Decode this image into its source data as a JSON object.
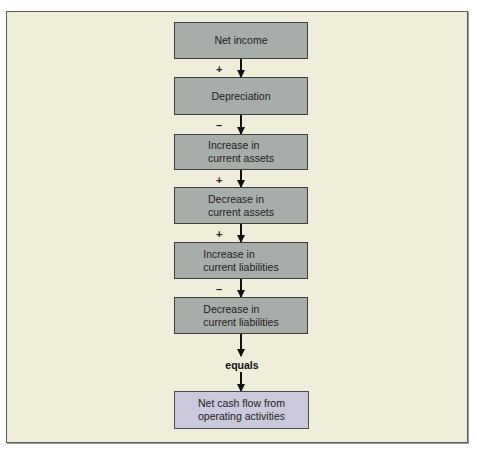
{
  "diagram": {
    "title": "",
    "colors": {
      "background": "#eeeedb",
      "box_fill": "#a7ada8",
      "final_box_fill": "#cbc9dc",
      "border": "#3d3f3e",
      "arrow": "#111111"
    },
    "steps": [
      {
        "label": "Net income"
      },
      {
        "label": "Depreciation"
      },
      {
        "label": "Increase in\ncurrent assets"
      },
      {
        "label": "Decrease in\ncurrent assets"
      },
      {
        "label": "Increase in\ncurrent liabilities"
      },
      {
        "label": "Decrease in\ncurrent liabilities"
      }
    ],
    "operators": [
      "+",
      "–",
      "+",
      "+",
      "–"
    ],
    "equals_label": "equals",
    "result": {
      "label": "Net cash flow from\noperating activities"
    }
  }
}
